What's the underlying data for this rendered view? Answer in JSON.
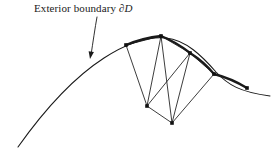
{
  "figure": {
    "background_color": "#ffffff",
    "ink_color": "#1a1a1a",
    "width": 280,
    "height": 153
  },
  "annotation": {
    "label_text": "Exterior boundary ",
    "label_symbol": "∂D",
    "label_full": "Exterior boundary ∂D",
    "leader": {
      "name": "leader-arrow",
      "path": "M 97 17 C 95 28, 93 42, 91 55",
      "arrow_tip": {
        "x": 90,
        "y": 59
      },
      "arrow_angle_deg": 100
    }
  },
  "chart_data": {
    "type": "diagram",
    "title": "Exterior boundary ∂D",
    "boundary_curve": {
      "name": "exterior-boundary-curve",
      "stroke_width_thin": 1.1,
      "stroke_width_thick": 2.4,
      "path": "M 18 147 C 40 116, 70 80, 104 58 C 124 45, 146 36, 166 38 C 186 40, 202 56, 216 72 C 228 85, 240 92, 270 96",
      "points": [
        {
          "x": 18,
          "y": 147
        },
        {
          "x": 104,
          "y": 58
        },
        {
          "x": 166,
          "y": 38
        },
        {
          "x": 216,
          "y": 72
        },
        {
          "x": 270,
          "y": 96
        }
      ]
    },
    "boundary_nodes": [
      {
        "id": "b1",
        "x": 126,
        "y": 45
      },
      {
        "id": "b2",
        "x": 161,
        "y": 36
      },
      {
        "id": "b3",
        "x": 190,
        "y": 53
      },
      {
        "id": "b4",
        "x": 214,
        "y": 74
      },
      {
        "id": "b5",
        "x": 247,
        "y": 88
      }
    ],
    "interior_nodes": [
      {
        "id": "i1",
        "x": 147,
        "y": 106
      },
      {
        "id": "i2",
        "x": 172,
        "y": 123
      }
    ],
    "mesh_edges": [
      {
        "from": "b1",
        "to": "i1"
      },
      {
        "from": "b2",
        "to": "i1"
      },
      {
        "from": "b2",
        "to": "i2"
      },
      {
        "from": "b3",
        "to": "i1"
      },
      {
        "from": "b3",
        "to": "i2"
      },
      {
        "from": "b4",
        "to": "i2"
      },
      {
        "from": "i1",
        "to": "i2"
      },
      {
        "from": "b1",
        "to": "b2"
      },
      {
        "from": "b2",
        "to": "b3"
      },
      {
        "from": "b3",
        "to": "b4"
      }
    ],
    "node_marker": {
      "shape": "square",
      "size": 3.6,
      "fill": "#111111"
    },
    "emphasized_boundary_segments": [
      {
        "from": "b1",
        "to": "b2"
      },
      {
        "from": "b2",
        "to": "b3"
      },
      {
        "from": "b3",
        "to": "b4"
      },
      {
        "from": "b4",
        "to": "b5"
      }
    ]
  }
}
